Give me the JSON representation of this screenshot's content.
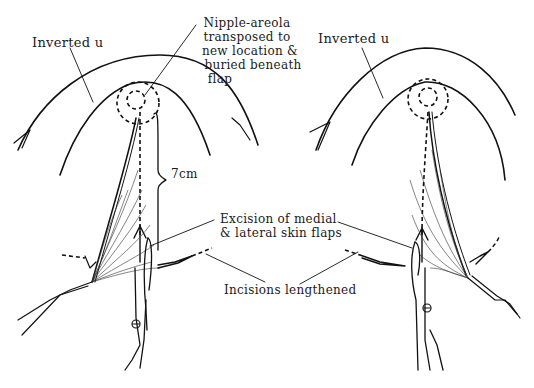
{
  "figure": {
    "type": "surgical-illustration",
    "panels": [
      {
        "id": "left",
        "labels": {
          "inverted_u": "Inverted u",
          "measurement": "7cm"
        }
      },
      {
        "id": "right",
        "labels": {
          "inverted_u": "Inverted u"
        }
      }
    ],
    "shared_labels": {
      "nipple_areola": [
        "Nipple-areola",
        "transposed to",
        "new location &",
        "buried beneath",
        "flap"
      ],
      "excision": [
        "Excision of medial",
        "& lateral skin flaps"
      ],
      "incisions": "Incisions lengthened"
    },
    "colors": {
      "ink": "#111111",
      "background": "#ffffff"
    }
  }
}
